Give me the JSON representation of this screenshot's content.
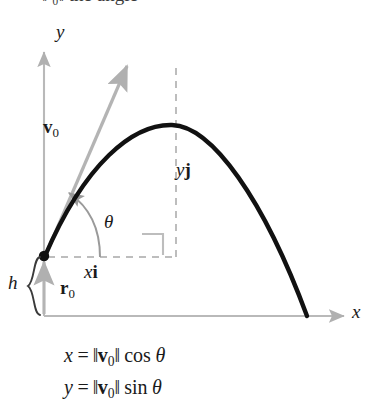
{
  "figure": {
    "title_fragment": "‖ ₀‖        the angle",
    "axes": {
      "y_label": "y",
      "x_label": "x",
      "axis_color": "#b9b9b9",
      "origin_px": [
        44,
        316
      ]
    },
    "labels": {
      "velocity_vector": {
        "symbol": "v",
        "subscript": "0"
      },
      "position_vector": {
        "symbol": "r",
        "subscript": "0"
      },
      "vertical_component": {
        "coefficient": "y",
        "unit_vector": "j"
      },
      "horizontal_component": {
        "coefficient": "x",
        "unit_vector": "i"
      },
      "angle": "θ",
      "height": "h"
    },
    "equations": [
      {
        "lhs": "x",
        "norm_symbol": "v",
        "norm_subscript": "0",
        "fn": "cos",
        "angle": "θ"
      },
      {
        "lhs": "y",
        "norm_symbol": "v",
        "norm_subscript": "0",
        "fn": "sin",
        "angle": "θ"
      }
    ],
    "colors": {
      "curve": "#111111",
      "axis_gray": "#b9b9b9",
      "vector_gray": "#b4b4b4",
      "dash_gray": "#bdbdbd",
      "text": "#1a1a1a"
    },
    "geometry": {
      "launch_point_px": [
        44,
        256
      ],
      "apex_px": [
        172,
        125
      ],
      "landing_px": [
        307,
        316
      ],
      "velocity_tip_px": [
        128,
        62
      ],
      "dashed_vertical_x": 130,
      "dashed_horizontal_y": 257,
      "brace_span_px": [
        256,
        316
      ]
    }
  }
}
